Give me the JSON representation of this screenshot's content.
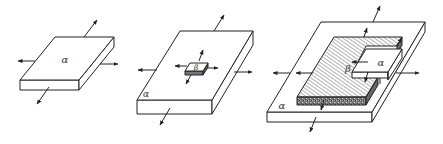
{
  "figure": {
    "colors": {
      "stroke": "#222222",
      "face": "#ffffff",
      "hatch": "#555555",
      "dark_edge": "#6e6e6e",
      "background": "#ffffff"
    },
    "panels": [
      {
        "id": "panel-1",
        "labels": {
          "matrix": "α"
        }
      },
      {
        "id": "panel-2",
        "labels": {
          "matrix": "α",
          "precipitate": "β"
        }
      },
      {
        "id": "panel-3",
        "labels": {
          "matrix": "α",
          "precipitate": "β",
          "residual": "α"
        }
      }
    ]
  }
}
